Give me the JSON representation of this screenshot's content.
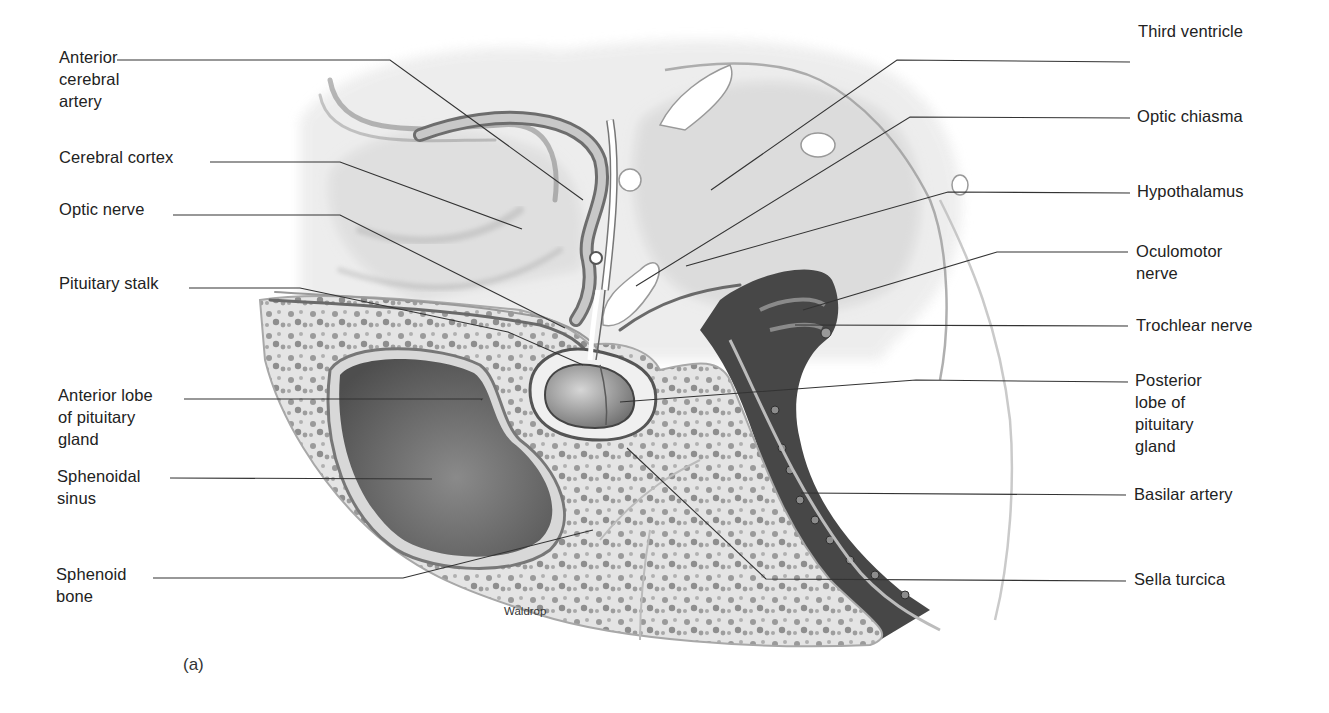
{
  "figure": {
    "panel_label": "(a)",
    "signature": "Waldrop",
    "colors": {
      "label_text": "#222222",
      "leader_line": "#333333",
      "background": "#ffffff"
    }
  },
  "labels_left": [
    {
      "id": "anterior-cerebral-artery",
      "text": "Anterior\ncerebral\nartery",
      "x": 59,
      "y": 46,
      "line": [
        [
          117,
          60
        ],
        [
          390,
          60
        ],
        [
          583,
          200
        ]
      ]
    },
    {
      "id": "cerebral-cortex",
      "text": "Cerebral cortex",
      "x": 59,
      "y": 146,
      "line": [
        [
          210,
          162
        ],
        [
          340,
          162
        ],
        [
          522,
          229
        ]
      ]
    },
    {
      "id": "optic-nerve",
      "text": "Optic nerve",
      "x": 59,
      "y": 198,
      "line": [
        [
          173,
          215
        ],
        [
          340,
          215
        ],
        [
          565,
          328
        ]
      ]
    },
    {
      "id": "pituitary-stalk",
      "text": "Pituitary stalk",
      "x": 59,
      "y": 272,
      "line": [
        [
          189,
          288
        ],
        [
          300,
          288
        ],
        [
          508,
          332
        ],
        [
          508,
          332
        ],
        [
          583,
          365
        ]
      ]
    },
    {
      "id": "anterior-lobe-pituitary",
      "text": "Anterior lobe\nof pituitary\ngland",
      "x": 58,
      "y": 382,
      "line": [
        [
          184,
          399
        ],
        [
          482,
          399
        ],
        [
          481,
          400
        ]
      ]
    },
    {
      "id": "sphenoidal-sinus",
      "text": "Sphenoidal\nsinus",
      "x": 57,
      "y": 468,
      "line": [
        [
          170,
          478
        ],
        [
          432,
          479
        ]
      ]
    },
    {
      "id": "sphenoid-bone",
      "text": "Sphenoid\nbone",
      "x": 56,
      "y": 563,
      "line": [
        [
          153,
          578
        ],
        [
          403,
          578
        ],
        [
          593,
          530
        ]
      ]
    }
  ],
  "labels_right": [
    {
      "id": "third-ventricle",
      "text": "Third ventricle",
      "x": 1138,
      "y": 20,
      "line": [
        [
          1130,
          62
        ],
        [
          897,
          60
        ],
        [
          711,
          190
        ]
      ]
    },
    {
      "id": "optic-chiasma",
      "text": "Optic chiasma",
      "x": 1137,
      "y": 105,
      "line": [
        [
          1130,
          118
        ],
        [
          910,
          117
        ],
        [
          636,
          286
        ]
      ]
    },
    {
      "id": "hypothalamus",
      "text": "Hypothalamus",
      "x": 1137,
      "y": 180,
      "line": [
        [
          1130,
          193
        ],
        [
          948,
          192
        ],
        [
          686,
          266
        ]
      ]
    },
    {
      "id": "oculomotor-nerve",
      "text": "Oculomotor\nnerve",
      "x": 1136,
      "y": 240,
      "line": [
        [
          1128,
          252
        ],
        [
          997,
          252
        ],
        [
          803,
          310
        ]
      ]
    },
    {
      "id": "trochlear-nerve",
      "text": "Trochlear nerve",
      "x": 1136,
      "y": 314,
      "line": [
        [
          1128,
          326
        ],
        [
          795,
          325
        ]
      ]
    },
    {
      "id": "posterior-lobe-pituitary",
      "text": "Posterior\nlobe of\npituitary\ngland",
      "x": 1135,
      "y": 367,
      "line": [
        [
          1128,
          382
        ],
        [
          916,
          380
        ],
        [
          620,
          402
        ]
      ]
    },
    {
      "id": "basilar-artery",
      "text": "Basilar artery",
      "x": 1134,
      "y": 481,
      "line": [
        [
          1126,
          495
        ],
        [
          801,
          493
        ]
      ]
    },
    {
      "id": "sella-turcica",
      "text": "Sella turcica",
      "x": 1134,
      "y": 566,
      "line": [
        [
          1126,
          581
        ],
        [
          766,
          579
        ],
        [
          627,
          448
        ]
      ]
    }
  ]
}
